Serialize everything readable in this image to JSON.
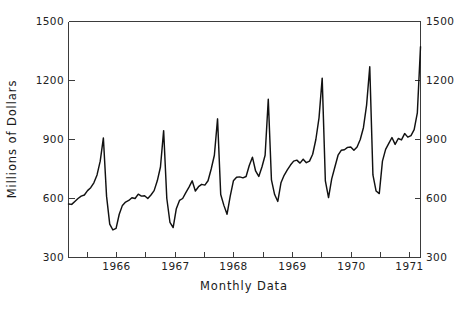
{
  "chart_data": {
    "type": "line",
    "title": "",
    "xlabel": "Monthly Data",
    "ylabel": "Millions of Dollars",
    "ylim": [
      300,
      1500
    ],
    "ytick_labels_left": [
      "300",
      "600",
      "900",
      "1200",
      "1500"
    ],
    "ytick_labels_right": [
      "300",
      "600",
      "900",
      "1200",
      "1500"
    ],
    "ytick_values": [
      300,
      600,
      900,
      1200,
      1500
    ],
    "xtick_labels": [
      "1966",
      "1967",
      "1968",
      "1969",
      "1970",
      "1971"
    ],
    "xtick_values": [
      1966,
      1967,
      1968,
      1969,
      1970,
      1971
    ],
    "x_minor_tick_count": 13,
    "xlim_months": [
      0,
      83
    ],
    "grid": false,
    "legend": null,
    "series": [
      {
        "name": "Monthly Sales",
        "x_start_label": "1965-01",
        "x_end_label": "1971-12",
        "values": [
          572,
          570,
          585,
          600,
          612,
          618,
          640,
          655,
          680,
          720,
          790,
          908,
          612,
          470,
          440,
          448,
          520,
          565,
          582,
          590,
          604,
          600,
          622,
          612,
          614,
          600,
          618,
          640,
          690,
          760,
          945,
          600,
          478,
          452,
          548,
          590,
          600,
          630,
          658,
          690,
          638,
          660,
          672,
          668,
          690,
          750,
          820,
          1005,
          620,
          565,
          520,
          612,
          690,
          708,
          710,
          705,
          712,
          768,
          810,
          740,
          712,
          760,
          820,
          1105,
          695,
          620,
          585,
          680,
          718,
          745,
          770,
          790,
          795,
          780,
          800,
          782,
          790,
          825,
          900,
          1010,
          1212,
          690,
          605,
          700,
          760,
          820,
          845,
          848,
          860,
          862,
          845,
          862,
          900,
          960,
          1075,
          1270,
          720,
          638,
          625,
          790,
          850,
          880,
          910,
          875,
          905,
          898,
          930,
          912,
          920,
          950,
          1035,
          1372
        ],
        "peaks": [
          {
            "label": "Dec 1965",
            "value": 908
          },
          {
            "label": "Dec 1966",
            "value": 945
          },
          {
            "label": "Dec 1967",
            "value": 1005
          },
          {
            "label": "Dec 1968",
            "value": 1105
          },
          {
            "label": "Dec 1969",
            "value": 1212
          },
          {
            "label": "Dec 1970",
            "value": 1270
          },
          {
            "label": "Dec 1971",
            "value": 1372
          }
        ],
        "troughs": [
          {
            "label": "Feb 1966",
            "value": 440
          },
          {
            "label": "Feb 1967",
            "value": 452
          },
          {
            "label": "Feb 1968",
            "value": 520
          },
          {
            "label": "Feb 1969",
            "value": 585
          },
          {
            "label": "Feb 1970",
            "value": 605
          },
          {
            "label": "Feb 1971",
            "value": 625
          }
        ],
        "color": "#111111"
      }
    ],
    "axis_color": "#3b3b3b",
    "background_color": "#ffffff"
  }
}
